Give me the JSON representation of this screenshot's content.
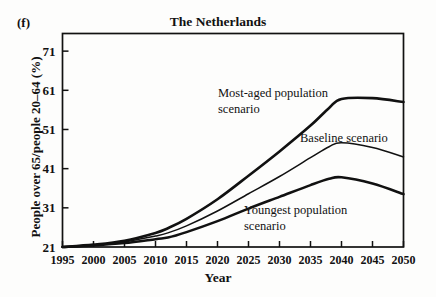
{
  "panel_letter": "(f)",
  "axis": {
    "y_title": "People over 65/people 20–64 (%)",
    "x_title": "Year",
    "y_ticks": [
      21,
      31,
      41,
      51,
      61,
      71
    ],
    "x_ticks": [
      1995,
      2000,
      2005,
      2010,
      2015,
      2020,
      2025,
      2030,
      2035,
      2040,
      2045,
      2050
    ]
  },
  "annotations": {
    "most_aged_line1": "Most-aged population",
    "most_aged_line2": "scenario",
    "baseline": "Baseline scenario",
    "youngest_line1": "Youngest population",
    "youngest_line2": "scenario"
  },
  "chart_data": {
    "type": "line",
    "title": "The Netherlands",
    "xlabel": "Year",
    "ylabel": "People over 65/people 20–64 (%)",
    "xlim": [
      1995,
      2050
    ],
    "ylim": [
      21,
      75.5
    ],
    "grid": false,
    "legend": "inline-annotations",
    "x": [
      1995,
      2000,
      2005,
      2010,
      2012,
      2015,
      2020,
      2025,
      2030,
      2035,
      2038,
      2040,
      2045,
      2050
    ],
    "series": [
      {
        "name": "Most-aged population scenario",
        "values": [
          21.0,
          21.6,
          22.6,
          24.6,
          25.8,
          28.2,
          33.2,
          39.2,
          45.4,
          52.0,
          56.5,
          58.8,
          59.0,
          58.0
        ]
      },
      {
        "name": "Baseline scenario",
        "values": [
          21.0,
          21.5,
          22.3,
          23.8,
          24.6,
          26.4,
          30.2,
          34.6,
          39.0,
          43.8,
          46.6,
          47.6,
          46.4,
          44.0
        ]
      },
      {
        "name": "Youngest population scenario",
        "values": [
          21.0,
          21.4,
          22.0,
          23.0,
          23.4,
          24.8,
          27.6,
          30.8,
          33.8,
          36.8,
          38.4,
          38.8,
          37.2,
          34.5
        ]
      }
    ]
  }
}
